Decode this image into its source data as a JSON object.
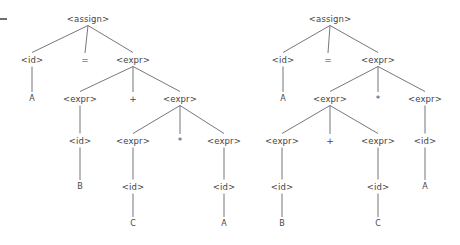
{
  "figure": {
    "kind": "parse-tree-pair",
    "grammar_symbols": [
      "<assign>",
      "<id>",
      "<expr>"
    ],
    "operators": [
      "=",
      "+",
      "*"
    ],
    "identifiers": [
      "A",
      "B",
      "C"
    ],
    "stray_mark": "-"
  },
  "trees": [
    {
      "name": "left-parse-tree",
      "sentence": "A = B + C * A",
      "grouping": "A = B + (C * A)",
      "nodes": [
        {
          "id": "L0",
          "label": "<assign>",
          "type": "nonterminal",
          "x": 88,
          "y": 19
        },
        {
          "id": "L1",
          "label": "<id>",
          "type": "nonterminal",
          "x": 32,
          "y": 60
        },
        {
          "id": "L2",
          "label": "=",
          "type": "operator",
          "x": 85,
          "y": 60
        },
        {
          "id": "L3",
          "label": "<expr>",
          "type": "nonterminal",
          "x": 133,
          "y": 60
        },
        {
          "id": "L4",
          "label": "A",
          "type": "terminal",
          "x": 32,
          "y": 99
        },
        {
          "id": "L5",
          "label": "<expr>",
          "type": "nonterminal",
          "x": 80,
          "y": 99
        },
        {
          "id": "L6",
          "label": "+",
          "type": "operator",
          "x": 133,
          "y": 99
        },
        {
          "id": "L7",
          "label": "<expr>",
          "type": "nonterminal",
          "x": 180,
          "y": 99
        },
        {
          "id": "L8",
          "label": "<id>",
          "type": "nonterminal",
          "x": 80,
          "y": 141
        },
        {
          "id": "L9",
          "label": "<expr>",
          "type": "nonterminal",
          "x": 133,
          "y": 141
        },
        {
          "id": "L10",
          "label": "*",
          "type": "operator",
          "x": 180,
          "y": 141
        },
        {
          "id": "L11",
          "label": "<expr>",
          "type": "nonterminal",
          "x": 224,
          "y": 141
        },
        {
          "id": "L12",
          "label": "B",
          "type": "terminal",
          "x": 80,
          "y": 187
        },
        {
          "id": "L13",
          "label": "<id>",
          "type": "nonterminal",
          "x": 133,
          "y": 187
        },
        {
          "id": "L14",
          "label": "<id>",
          "type": "nonterminal",
          "x": 224,
          "y": 187
        },
        {
          "id": "L15",
          "label": "C",
          "type": "terminal",
          "x": 133,
          "y": 224
        },
        {
          "id": "L16",
          "label": "A",
          "type": "terminal",
          "x": 224,
          "y": 224
        }
      ],
      "edges": [
        [
          "L0",
          "L1"
        ],
        [
          "L0",
          "L2"
        ],
        [
          "L0",
          "L3"
        ],
        [
          "L1",
          "L4"
        ],
        [
          "L3",
          "L5"
        ],
        [
          "L3",
          "L6"
        ],
        [
          "L3",
          "L7"
        ],
        [
          "L5",
          "L8"
        ],
        [
          "L7",
          "L9"
        ],
        [
          "L7",
          "L10"
        ],
        [
          "L7",
          "L11"
        ],
        [
          "L8",
          "L12"
        ],
        [
          "L9",
          "L13"
        ],
        [
          "L11",
          "L14"
        ],
        [
          "L13",
          "L15"
        ],
        [
          "L14",
          "L16"
        ]
      ]
    },
    {
      "name": "right-parse-tree",
      "sentence": "A = B + C * A",
      "grouping": "A = (B + C) * A",
      "nodes": [
        {
          "id": "R0",
          "label": "<assign>",
          "type": "nonterminal",
          "x": 330,
          "y": 19
        },
        {
          "id": "R1",
          "label": "<id>",
          "type": "nonterminal",
          "x": 283,
          "y": 60
        },
        {
          "id": "R2",
          "label": "=",
          "type": "operator",
          "x": 328,
          "y": 60
        },
        {
          "id": "R3",
          "label": "<expr>",
          "type": "nonterminal",
          "x": 378,
          "y": 60
        },
        {
          "id": "R4",
          "label": "A",
          "type": "terminal",
          "x": 283,
          "y": 99
        },
        {
          "id": "R5",
          "label": "<expr>",
          "type": "nonterminal",
          "x": 330,
          "y": 99
        },
        {
          "id": "R6",
          "label": "*",
          "type": "operator",
          "x": 378,
          "y": 99
        },
        {
          "id": "R7",
          "label": "<expr>",
          "type": "nonterminal",
          "x": 425,
          "y": 99
        },
        {
          "id": "R8",
          "label": "<expr>",
          "type": "nonterminal",
          "x": 282,
          "y": 141
        },
        {
          "id": "R9",
          "label": "+",
          "type": "operator",
          "x": 330,
          "y": 141
        },
        {
          "id": "R10",
          "label": "<expr>",
          "type": "nonterminal",
          "x": 378,
          "y": 141
        },
        {
          "id": "R11",
          "label": "<id>",
          "type": "nonterminal",
          "x": 425,
          "y": 141
        },
        {
          "id": "R12",
          "label": "<id>",
          "type": "nonterminal",
          "x": 282,
          "y": 187
        },
        {
          "id": "R13",
          "label": "<id>",
          "type": "nonterminal",
          "x": 378,
          "y": 187
        },
        {
          "id": "R14",
          "label": "A",
          "type": "terminal",
          "x": 425,
          "y": 187
        },
        {
          "id": "R15",
          "label": "B",
          "type": "terminal",
          "x": 282,
          "y": 224
        },
        {
          "id": "R16",
          "label": "C",
          "type": "terminal",
          "x": 378,
          "y": 224
        }
      ],
      "edges": [
        [
          "R0",
          "R1"
        ],
        [
          "R0",
          "R2"
        ],
        [
          "R0",
          "R3"
        ],
        [
          "R1",
          "R4"
        ],
        [
          "R3",
          "R5"
        ],
        [
          "R3",
          "R6"
        ],
        [
          "R3",
          "R7"
        ],
        [
          "R5",
          "R8"
        ],
        [
          "R5",
          "R9"
        ],
        [
          "R5",
          "R10"
        ],
        [
          "R7",
          "R11"
        ],
        [
          "R8",
          "R12"
        ],
        [
          "R10",
          "R13"
        ],
        [
          "R11",
          "R14"
        ],
        [
          "R12",
          "R15"
        ],
        [
          "R13",
          "R16"
        ]
      ]
    }
  ],
  "style": {
    "edge_color": "#5d5d66",
    "text_color": "#3f3f46",
    "background": "#ffffff"
  }
}
